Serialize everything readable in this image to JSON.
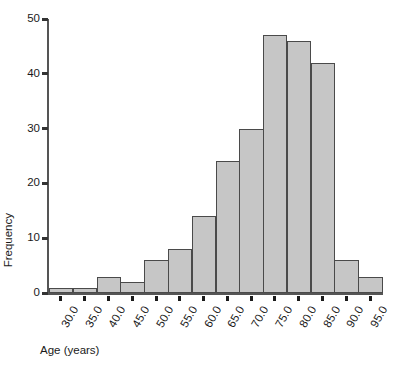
{
  "chart_data": {
    "type": "bar",
    "title": "",
    "subtitle": "",
    "xlabel": "Age (years)",
    "ylabel": "Frequency",
    "categories": [
      "30.0",
      "35.0",
      "40.0",
      "45.0",
      "50.0",
      "55.0",
      "60.0",
      "65.0",
      "70.0",
      "75.0",
      "80.0",
      "85.0",
      "90.0",
      "95.0"
    ],
    "values": [
      1,
      1,
      3,
      2,
      6,
      8,
      14,
      24,
      30,
      47,
      46,
      42,
      6,
      3
    ],
    "x_tick_labels": [
      "30.0",
      "35.0",
      "40.0",
      "45.0",
      "50.0",
      "55.0",
      "60.0",
      "65.0",
      "70.0",
      "75.0",
      "80.0",
      "85.0",
      "90.0",
      "95.0"
    ],
    "y_tick_labels": [
      "0",
      "10",
      "20",
      "30",
      "40",
      "50"
    ],
    "y_tick_values": [
      0,
      10,
      20,
      30,
      40,
      50
    ],
    "ylim": [
      0,
      50
    ],
    "xlim": [
      27.5,
      97.5
    ],
    "bin_width": 5,
    "grid": false,
    "legend": false,
    "legend_position": "none",
    "bar_fill_color": "#c6c6c6",
    "bar_border_color": "#4a4a4a",
    "axis_color": "#555555",
    "text_color": "#1a1a1a",
    "background_color": "#ffffff"
  }
}
